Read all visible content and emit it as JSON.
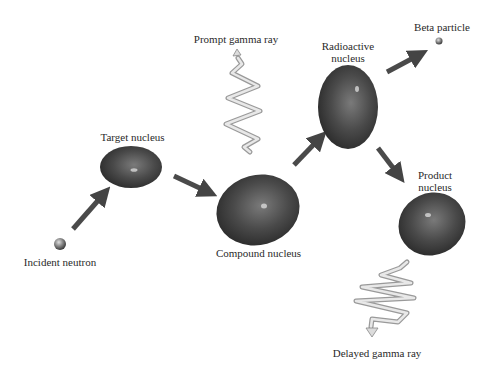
{
  "labels": {
    "incident_neutron": "Incident neutron",
    "target_nucleus": "Target nucleus",
    "compound_nucleus": "Compound nucleus",
    "prompt_gamma_ray": "Prompt gamma ray",
    "radioactive_nucleus_line1": "Radioactive",
    "radioactive_nucleus_line2": "nucleus",
    "beta_particle": "Beta particle",
    "product_nucleus_line1": "Product",
    "product_nucleus_line2": "nucleus",
    "delayed_gamma_ray": "Delayed gamma ray"
  },
  "flow": [
    {
      "from": "incident_neutron",
      "to": "target_nucleus"
    },
    {
      "from": "target_nucleus",
      "to": "compound_nucleus"
    },
    {
      "from": "compound_nucleus",
      "to": "radioactive_nucleus"
    },
    {
      "from": "radioactive_nucleus",
      "to": "beta_particle"
    },
    {
      "from": "radioactive_nucleus",
      "to": "product_nucleus"
    }
  ],
  "colors": {
    "nucleus": "#4a4a4a",
    "nucleus_dark": "#2c2c2c",
    "arrow": "#555555",
    "gamma": "#c8c8c8",
    "text": "#2a2a2a"
  }
}
